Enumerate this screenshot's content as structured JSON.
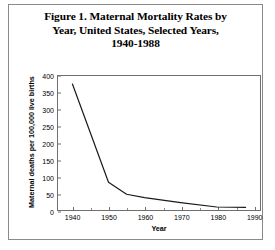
{
  "figure": {
    "title_lines": [
      "Figure 1. Maternal Mortality Rates by",
      "Year, United States, Selected Years,",
      "1940-1988"
    ],
    "title_full": "Figure 1. Maternal Mortality Rates by Year, United States, Selected Years, 1940-1988"
  },
  "chart_data": {
    "type": "line",
    "title": "Figure 1. Maternal Mortality Rates by Year, United States, Selected Years, 1940-1988",
    "xlabel": "Year",
    "ylabel": "Maternal deaths per 100,000 live births",
    "xlim": [
      1936,
      1992
    ],
    "ylim": [
      0,
      400
    ],
    "yticks": [
      0,
      50,
      100,
      150,
      200,
      250,
      300,
      350,
      400
    ],
    "ytick_labels": [
      "0",
      "50",
      "100",
      "150",
      "200",
      "250",
      "300",
      "350",
      "400"
    ],
    "xticks": [
      1940,
      1950,
      1960,
      1970,
      1980,
      1990
    ],
    "xtick_labels": [
      "1940",
      "1950",
      "1960",
      "1970",
      "1980",
      "1990"
    ],
    "x_minor_ticks": [
      1945,
      1955,
      1965,
      1975,
      1985
    ],
    "grid": false,
    "legend": false,
    "line_color": "#1a1a1a",
    "line_width": 1.2,
    "x": [
      1940,
      1950,
      1955,
      1960,
      1970,
      1980,
      1988
    ],
    "values": [
      376,
      83,
      47,
      37,
      22,
      9,
      8
    ],
    "series": [
      {
        "name": "Maternal mortality rate",
        "points": [
          {
            "year": 1940,
            "rate": 376
          },
          {
            "year": 1950,
            "rate": 83
          },
          {
            "year": 1955,
            "rate": 47
          },
          {
            "year": 1960,
            "rate": 37
          },
          {
            "year": 1970,
            "rate": 22
          },
          {
            "year": 1980,
            "rate": 9
          },
          {
            "year": 1988,
            "rate": 8
          }
        ]
      }
    ]
  }
}
